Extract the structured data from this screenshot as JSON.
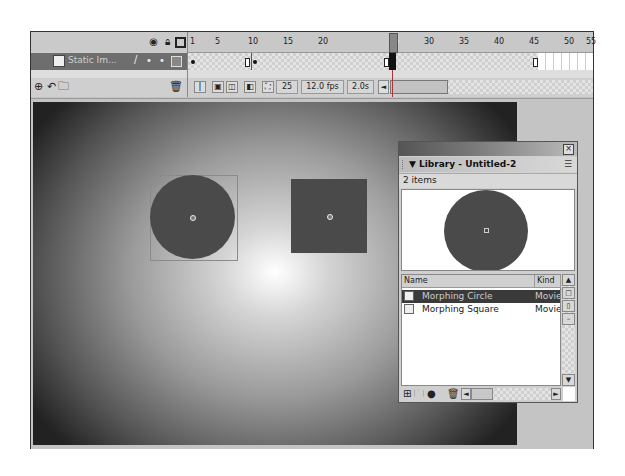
{
  "timeline": {
    "header_icons": [
      "eye-icon",
      "lock-icon",
      "outline-icon"
    ],
    "layer": {
      "name": "Static Im...",
      "icon": "layer-icon",
      "edit_icon": "pencil-icon"
    },
    "layer_tools": [
      "insert-layer-icon",
      "add-motion-guide-icon",
      "insert-folder-icon",
      "delete-layer-icon"
    ],
    "ruler": [
      "1",
      "5",
      "10",
      "15",
      "20",
      "25",
      "30",
      "35",
      "40",
      "45",
      "50",
      "55"
    ],
    "current_frame": "25",
    "keyframes": [
      1,
      10,
      50
    ],
    "status": {
      "frame": "25",
      "fps": "12.0 fps",
      "time": "2.0s",
      "scroll_left": "◄"
    }
  },
  "stage": {
    "objects": [
      {
        "type": "circle",
        "name": "Morphing Circle instance"
      },
      {
        "type": "square",
        "name": "Morphing Square instance"
      }
    ]
  },
  "library": {
    "close": "×",
    "title": "▼ Library - Untitled-2",
    "menu_icon": "☰",
    "count": "2 items",
    "columns": {
      "name": "Name",
      "kind": "Kind"
    },
    "items": [
      {
        "name": "Morphing Circle",
        "kind": "Movie Clip",
        "selected": true
      },
      {
        "name": "Morphing Square",
        "kind": "Movie Clip",
        "selected": false
      }
    ],
    "scroll": {
      "up": "▲",
      "down": "▼",
      "left": "◄",
      "right": "►"
    }
  }
}
